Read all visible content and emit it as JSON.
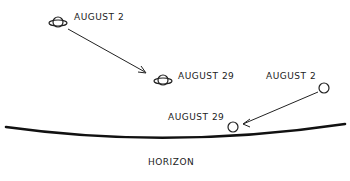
{
  "diagram": {
    "saturn": {
      "start_label": "AUGUST 2",
      "end_label": "AUGUST 29"
    },
    "planet": {
      "start_label": "AUGUST 2",
      "end_label": "AUGUST 29"
    },
    "horizon_label": "HORIZON",
    "ink_color": "#222222"
  }
}
